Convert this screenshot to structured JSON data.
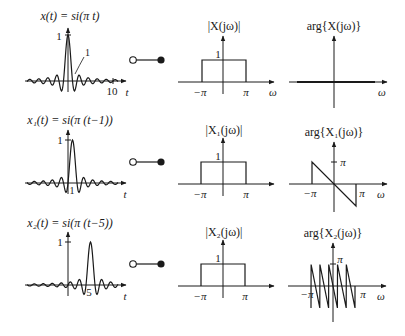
{
  "rows": [
    {
      "time_title": "x(t) = si(π t)",
      "time_title_parts": {
        "lhs": "x(t) = ",
        "rhs": "si(π t)"
      },
      "time_peak_label": "1",
      "time_annot_label": "1",
      "time_tick_label": "10",
      "time_axis_label": "t",
      "shift": 0,
      "mag_title": "|X(jω)|",
      "mag_level_label": "1",
      "mag_neg_label": "−π",
      "mag_pos_label": "π",
      "mag_axis_label": "ω",
      "phase_title": "arg{X(jω)}",
      "phase_axis_label": "ω"
    },
    {
      "time_title": "x₁(t) = si(π (t−1))",
      "time_peak_label": "1",
      "time_tick_label": "1",
      "time_axis_label": "t",
      "shift": 1,
      "mag_title": "|X₁(jω)|",
      "mag_level_label": "1",
      "mag_neg_label": "−π",
      "mag_pos_label": "π",
      "mag_axis_label": "ω",
      "phase_title": "arg{X₁(jω)}",
      "phase_pi_label": "π",
      "phase_neg_label": "−π",
      "phase_pos_label": "π",
      "phase_axis_label": "ω"
    },
    {
      "time_title": "x₂(t) = si(π (t−5))",
      "time_peak_label": "1",
      "time_tick_label": "5",
      "time_axis_label": "t",
      "shift": 5,
      "mag_title": "|X₂(jω)|",
      "mag_level_label": "1",
      "mag_neg_label": "−π",
      "mag_pos_label": "π",
      "mag_axis_label": "ω",
      "phase_title": "arg{X₂(jω)}",
      "phase_pi_label": "π",
      "phase_neg_label": "−π",
      "phase_pos_label": "π",
      "phase_axis_label": "ω"
    }
  ],
  "connector": {
    "icon": "fourier-correspondence-icon"
  },
  "colors": {
    "ink": "#1a1a1a",
    "background": "#ffffff"
  }
}
